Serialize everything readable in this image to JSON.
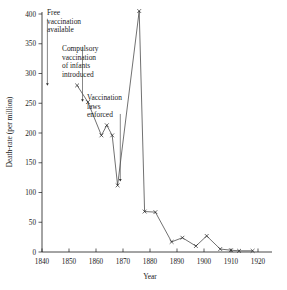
{
  "chart_data": {
    "type": "line",
    "title": "",
    "xlabel": "Year",
    "ylabel": "Death-rate (per million)",
    "xlim": [
      1840,
      1920
    ],
    "ylim": [
      0,
      400
    ],
    "xticks": [
      1840,
      1850,
      1860,
      1870,
      1880,
      1890,
      1900,
      1910,
      1920
    ],
    "xticklabels": [
      "1840",
      "1850",
      "1860",
      "1870",
      "1880",
      "1890",
      "1900",
      "1910",
      "1920"
    ],
    "yticks": [
      0,
      50,
      100,
      150,
      200,
      250,
      300,
      350,
      400
    ],
    "yticklabels": [
      "0",
      "50",
      "100",
      "150",
      "200",
      "250",
      "300",
      "350",
      "400"
    ],
    "grid": false,
    "legend": "none",
    "marker": "x",
    "series": [
      {
        "name": "Smallpox death-rate",
        "points": [
          [
            1853,
            280
          ],
          [
            1857,
            252
          ],
          [
            1862,
            196
          ],
          [
            1864,
            213
          ],
          [
            1866,
            196
          ],
          [
            1868,
            112
          ],
          [
            1876,
            405
          ],
          [
            1878,
            68
          ],
          [
            1882,
            67
          ],
          [
            1888,
            17
          ],
          [
            1892,
            24
          ],
          [
            1897,
            10
          ],
          [
            1901,
            27
          ],
          [
            1906,
            5
          ],
          [
            1910,
            3
          ],
          [
            1913,
            2
          ],
          [
            1918,
            2
          ]
        ]
      }
    ],
    "annotations": [
      {
        "name": "free-vaccination-available",
        "text_lines": [
          "Free",
          "vaccination",
          "available"
        ],
        "arrow_year": 1842,
        "arrow_from_value": 392,
        "arrow_to_value": 281
      },
      {
        "name": "compulsory-vaccination-of-infants-introduced",
        "text_lines": [
          "Compulsory",
          "vaccination",
          "of infants",
          "introduced"
        ],
        "arrow_year": 1855,
        "arrow_from_value": 345,
        "arrow_to_value": 254
      },
      {
        "name": "vaccination-laws-enforced",
        "text_lines": [
          "Vaccination",
          "laws",
          "enforced"
        ],
        "arrow_year": 1869,
        "arrow_from_value": 232,
        "arrow_to_value": 120
      }
    ]
  }
}
